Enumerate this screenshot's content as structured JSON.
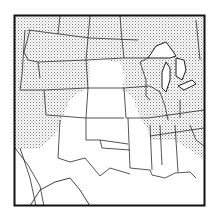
{
  "map": {
    "description": "Map of the central and western United States with stippled shaded regions",
    "frame": {
      "x": 14,
      "y": 15,
      "width": 191,
      "height": 191
    },
    "colors": {
      "background": "#ffffff",
      "lines": "#222222",
      "stipple": "#8a8a8a",
      "lakes": "#ffffff"
    },
    "regions": [
      {
        "name": "shaded-north-west",
        "shaded": true
      },
      {
        "name": "shaded-east",
        "shaded": true
      },
      {
        "name": "unshaded-plains",
        "shaded": false
      },
      {
        "name": "unshaded-south",
        "shaded": false
      }
    ]
  }
}
